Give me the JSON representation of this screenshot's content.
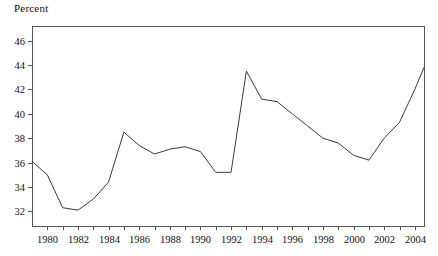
{
  "chart_data": {
    "type": "line",
    "title": "",
    "ylabel": "Percent",
    "xlabel": "",
    "ylim": [
      30.8,
      47.2
    ],
    "xlim": [
      1979,
      2004.6
    ],
    "grid": false,
    "legend": null,
    "yticks": [
      32,
      34,
      36,
      38,
      40,
      42,
      44,
      46
    ],
    "ytick_labels": [
      "32",
      "34",
      "36",
      "38",
      "40",
      "42",
      "44",
      "46"
    ],
    "xticks": [
      1980,
      1981,
      1982,
      1983,
      1984,
      1985,
      1986,
      1987,
      1988,
      1989,
      1990,
      1991,
      1992,
      1993,
      1994,
      1995,
      1996,
      1997,
      1998,
      1999,
      2000,
      2001,
      2002,
      2003,
      2004
    ],
    "xtick_labels": [
      "1980",
      "",
      "1982",
      "",
      "1984",
      "",
      "1986",
      "",
      "1988",
      "",
      "1990",
      "",
      "1992",
      "",
      "1994",
      "",
      "1996",
      "",
      "1998",
      "",
      "2000",
      "",
      "2002",
      "",
      "2004"
    ],
    "series": [
      {
        "name": "Percent",
        "color": "#3a3a3a",
        "x": [
          1979,
          1980,
          1981,
          1982,
          1983,
          1984,
          1985,
          1986,
          1987,
          1988,
          1989,
          1990,
          1991,
          1992,
          1993,
          1994,
          1995,
          1996,
          1997,
          1998,
          1999,
          2000,
          2001,
          2002,
          2003,
          2004,
          2004.6
        ],
        "values": [
          36.1,
          35.0,
          32.3,
          32.1,
          33.0,
          34.4,
          38.5,
          37.4,
          36.7,
          37.1,
          37.3,
          36.9,
          35.2,
          35.2,
          43.5,
          41.2,
          41.0,
          40.0,
          39.0,
          38.0,
          37.6,
          36.6,
          36.2,
          38.0,
          39.3,
          42.0,
          43.8
        ]
      }
    ]
  },
  "axis": {
    "frame_color": "#555555",
    "line_color": "#3a3a3a"
  }
}
